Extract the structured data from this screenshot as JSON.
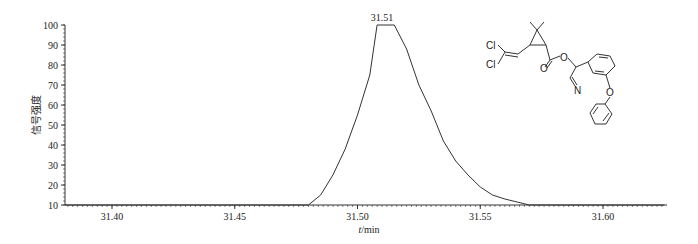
{
  "chart_data": {
    "type": "line",
    "title": "",
    "xlabel": "t/min",
    "xlabel_italic_part": "t",
    "xlabel_unit_part": "/min",
    "ylabel": "信号强度",
    "xlim": [
      31.38,
      31.625
    ],
    "ylim": [
      10,
      100
    ],
    "x_ticks": [
      "31.40",
      "31.45",
      "31.50",
      "31.55",
      "31.60"
    ],
    "y_ticks": [
      "10",
      "20",
      "30",
      "40",
      "50",
      "60",
      "70",
      "80",
      "90",
      "100"
    ],
    "grid": false,
    "legend": null,
    "annotations": [
      {
        "text": "31.51",
        "x": 31.51,
        "y": 100
      }
    ],
    "series": [
      {
        "name": "signal",
        "x": [
          31.38,
          31.48,
          31.485,
          31.49,
          31.495,
          31.5,
          31.505,
          31.508,
          31.515,
          31.52,
          31.525,
          31.53,
          31.535,
          31.54,
          31.545,
          31.55,
          31.555,
          31.56,
          31.565,
          31.57,
          31.625
        ],
        "values": [
          10,
          10,
          15,
          25,
          38,
          55,
          75,
          100,
          100,
          88,
          70,
          57,
          42,
          32,
          25,
          19,
          15,
          13,
          11.5,
          10,
          10
        ]
      }
    ],
    "inset": {
      "type": "chemical-structure",
      "labels": [
        "Cl",
        "Cl",
        "O",
        "O",
        "N",
        "O"
      ]
    }
  }
}
